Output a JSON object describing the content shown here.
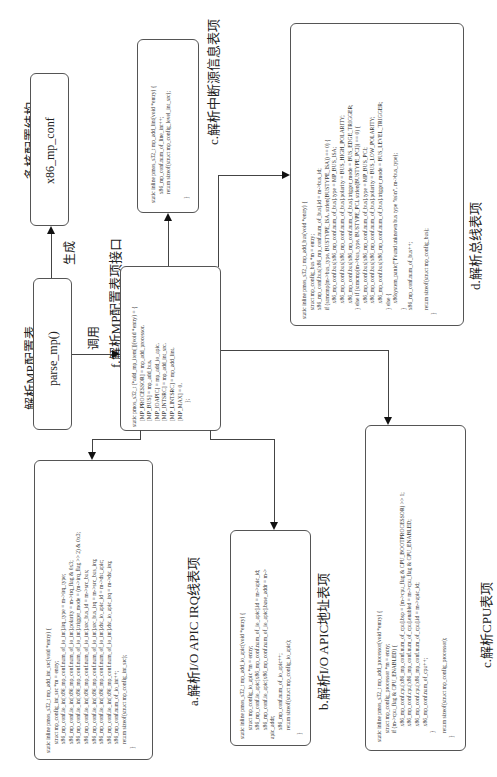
{
  "orientation": "rotated-90-ccw",
  "titles": {
    "multicore_config": "多核配置结构",
    "parse_mp_table": "解析MP配置表",
    "generate": "生成",
    "call": "调用",
    "f_label": "f.解析MP配置表项接口",
    "c_interrupt_label": "c.解析中断源信息表项",
    "d_label": "d.解析总线表项",
    "a_label": "a.解析I/O APIC IRQ线表项",
    "b_label": "b.解析I/O APIC地址表项",
    "e_label": "c.解析CPU表项"
  },
  "nodes": {
    "x86_mp_conf": "x86_mp_conf",
    "parse_mp": "parse_mp()"
  },
  "code": {
    "f": [
      "static pmos_s32_t (*add_mp_item[])(void *entry) = {",
      "[MP_PROCESSOR] = mp_add_processor,",
      "[MP_BUS] = mp_add_bus,",
      "[MP_IOAPIC] = mp_add_io_apic,",
      "[MP_INTSRC] = mp_add_int_src,",
      "[MP_LINTSRC] = mp_add_lint,",
      "[MP_MAX] = 0,",
      "};"
    ],
    "c_interrupt": [
      "static inline pmos_s32_t mp_add_lint(void *entry) {",
      "  x86_mp_conf.num_of_line_int++;",
      "  return sizeof(struct mp_config_level_int_src);",
      "}"
    ],
    "d": [
      "static inline pmos_s32_t mp_add_bus(void *entry) {",
      "  struct mp_config_bus *m = entry;",
      "  x86_mp_conf.bus[x86_mp_conf.num_of_bus].id = m->bus_id;",
      "  if (strncmp(m->bus_type, BUSTYPE_ISA, strlen(BUSTYPE_ISA)) == 0) {",
      "    x86_mp_conf.bus[x86_mp_conf.num_of_bus].type = MP_BUS_ISA;",
      "    x86_mp_conf.bus[x86_mp_conf.num_of_bus].polarity = BUS_HIGH_POLARITY;",
      "    x86_mp_conf.bus[x86_mp_conf.num_of_bus].trigger_mode = BUS_EDGE_TRIGGER;",
      "  } else if (strncmp(m->bus_type, BUSTYPE_PCI, strlen(BUSTYPE_PCI)) == 0) {",
      "    x86_mp_conf.bus[x86_mp_conf.num_of_bus].type = MP_BUS_PCI;",
      "    x86_mp_conf.bus[x86_mp_conf.num_of_bus].polarity = BUS_LOW_POLARITY;",
      "    x86_mp_conf.bus[x86_mp_conf.num_of_bus].trigger_mode = BUS_LEVEL_TRIGGER;",
      "  } else {",
      "    x86system_panic(\"Found unknown bus type %s\\n\", m->bus_type);",
      "  }",
      "  x86_mp_conf.num_of_bus++;",
      "",
      "  return sizeof(struct mp_config_bus);",
      "}"
    ],
    "a": [
      "static inline pmos_s32_t mp_add_int_src(void *entry) {",
      "  struct mp_config_int_src *m = entry;",
      "  x86_mp_conf.io_int[x86_mp_conf.num_of_io_int].irq_type = m->irq_type;",
      "  x86_mp_conf.io_int[x86_mp_conf.num_of_io_int].polarity = m->irq_flag & 0x3;",
      "  x86_mp_conf.io_int[x86_mp_conf.num_of_io_int].trigger_mode = (m->irq_flag >> 2) & 0x3;",
      "  x86_mp_conf.io_int[x86_mp_conf.num_of_io_int].src_bus_id = m->src_bus;",
      "  x86_mp_conf.io_int[x86_mp_conf.num_of_io_int].src_bus_irq = m->src_bus_irq;",
      "  x86_mp_conf.io_int[x86_mp_conf.num_of_io_int].dst_io_apic_id = m->dst_apic;",
      "  x86_mp_conf.io_int[x86_mp_conf.num_of_io_int].dst_io_apic_irq = m->dst_irq;",
      "  x86_mp_conf.num_of_io_int++;",
      "  return sizeof(struct mp_config_int_src);",
      "}"
    ],
    "b": [
      "static inline pmos_s32_t mp_add_io_apic(void *entry) {",
      "  struct mp_config_io_apic *m = entry;",
      "  x86_mp_conf.io_apic[x86_mp_conf.num_of_io_apic].id = m->apic_id;",
      "  x86_mp_conf.io_apic[x86_mp_conf.num_of_io_apic].base_addr = m->",
      "apic_addr;",
      "  x86_mp_conf.num_of_io_apic++;",
      "  return sizeof(struct mp_config_io_apic);",
      "}"
    ],
    "e": [
      "static inline pmos_s32_t mp_add_processor(void *entry) {",
      "  struct mp_config_processor *m = entry;",
      "  if (m->cpu_flag & CPU_ENABLED) {",
      "    x86_mp_conf.cpu[x86_mp_conf.num_of_cpu].bsp = (m->cpu_flag & CPU_BOOTPROCESSOR) >> 1;",
      "    x86_mp_conf.cpu[x86_mp_conf.num_of_cpu].enabled = m->cpu_flag & CPU_ENABLED;",
      "    x86_mp_conf.cpu[x86_mp_conf.num_of_cpu].id = m->apic_id;",
      "    x86_mp_conf.num_of_cpu++;",
      "  }",
      "  return sizeof(struct mp_config_processor);",
      "}"
    ]
  }
}
